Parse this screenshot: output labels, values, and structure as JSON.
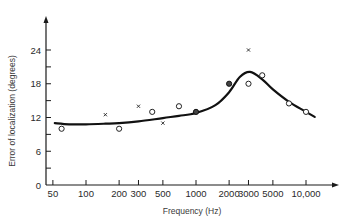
{
  "chart_data": {
    "type": "scatter",
    "title": "",
    "xlabel": "Frequency (Hz)",
    "ylabel": "Error of localization (degrees)",
    "xscale": "log",
    "xlim": [
      50,
      13000
    ],
    "ylim": [
      0,
      27
    ],
    "grid": false,
    "legend": null,
    "x_ticks": [
      {
        "value": 50,
        "label": "50"
      },
      {
        "value": 100,
        "label": "100"
      },
      {
        "value": 200,
        "label": "200"
      },
      {
        "value": 300,
        "label": "300"
      },
      {
        "value": 500,
        "label": "500"
      },
      {
        "value": 1000,
        "label": "1000"
      },
      {
        "value": 2000,
        "label": "2000"
      },
      {
        "value": 3000,
        "label": "3000"
      },
      {
        "value": 5000,
        "label": "5000"
      },
      {
        "value": 10000,
        "label": "10,000"
      }
    ],
    "y_ticks": [
      {
        "value": 0,
        "label": "0"
      },
      {
        "value": 6,
        "label": "6"
      },
      {
        "value": 12,
        "label": "12"
      },
      {
        "value": 18,
        "label": "18"
      },
      {
        "value": 24,
        "label": "24"
      }
    ],
    "y_minor_ticks": [
      3,
      9,
      15,
      21
    ],
    "series": [
      {
        "name": "open circles",
        "marker": "circle-open",
        "points": [
          [
            60,
            10
          ],
          [
            200,
            10
          ],
          [
            400,
            13
          ],
          [
            700,
            14
          ],
          [
            3000,
            18
          ],
          [
            4000,
            19.5
          ],
          [
            7000,
            14.5
          ],
          [
            10000,
            13
          ]
        ]
      },
      {
        "name": "filled circles",
        "marker": "circle-filled",
        "points": [
          [
            1000,
            13
          ],
          [
            2000,
            18
          ]
        ]
      },
      {
        "name": "crosses",
        "marker": "x",
        "points": [
          [
            150,
            12.5
          ],
          [
            300,
            14
          ],
          [
            500,
            11
          ],
          [
            3000,
            24
          ]
        ]
      },
      {
        "name": "fitted curve",
        "marker": "line",
        "points": [
          [
            52,
            11
          ],
          [
            70,
            10.8
          ],
          [
            100,
            10.8
          ],
          [
            150,
            10.9
          ],
          [
            200,
            11
          ],
          [
            300,
            11.3
          ],
          [
            500,
            11.9
          ],
          [
            700,
            12.3
          ],
          [
            1000,
            12.8
          ],
          [
            1500,
            14.2
          ],
          [
            2000,
            16.5
          ],
          [
            2500,
            19.2
          ],
          [
            3100,
            20.1
          ],
          [
            4000,
            18.8
          ],
          [
            5000,
            17
          ],
          [
            7000,
            14.8
          ],
          [
            10000,
            13
          ],
          [
            12000,
            12.1
          ]
        ]
      }
    ]
  }
}
